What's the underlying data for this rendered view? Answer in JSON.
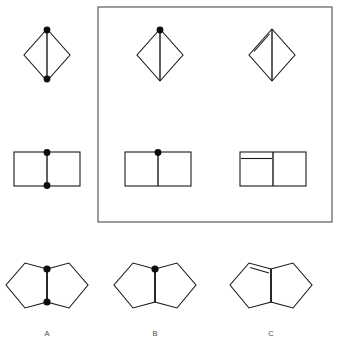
{
  "figure": {
    "title": "",
    "background_color": "#ffffff",
    "stroke_color": "#1a1a1a",
    "dot_color": "#0d0d0d",
    "box_color": "#5a5a5a",
    "width": 340,
    "height": 346
  },
  "answer_box": {
    "name": "answer-box-frame",
    "x": 98,
    "y": 7,
    "width": 234,
    "height": 215
  },
  "rows": [
    {
      "id": "row-diamond",
      "shape": "diamond",
      "items": [
        {
          "id": "diamond-prompt",
          "position": "left-outside-box",
          "cx": 47,
          "cy": 55,
          "rx": 23,
          "ry": 26,
          "divider": "vertical",
          "dots": [
            "top",
            "bottom"
          ],
          "double_edge": "none"
        },
        {
          "id": "diamond-option-1",
          "position": "in-box-left",
          "cx": 160,
          "cy": 55,
          "rx": 23,
          "ry": 26,
          "divider": "vertical",
          "dots": [
            "top"
          ],
          "double_edge": "none"
        },
        {
          "id": "diamond-option-2",
          "position": "in-box-right",
          "cx": 272,
          "cy": 55,
          "rx": 23,
          "ry": 26,
          "divider": "vertical",
          "dots": [],
          "double_edge": "upper-left"
        }
      ]
    },
    {
      "id": "row-rectangle",
      "shape": "rectangle",
      "items": [
        {
          "id": "rectangle-prompt",
          "position": "left-outside-box",
          "x": 14,
          "y": 152,
          "width": 66,
          "height": 34,
          "divider": "vertical-center",
          "dots": [
            "top",
            "bottom"
          ],
          "double_edge": "none"
        },
        {
          "id": "rectangle-option-1",
          "position": "in-box-left",
          "x": 125,
          "y": 152,
          "width": 66,
          "height": 34,
          "divider": "vertical-center",
          "dots": [
            "top"
          ],
          "double_edge": "none"
        },
        {
          "id": "rectangle-option-2",
          "position": "in-box-right",
          "x": 240,
          "y": 152,
          "width": 66,
          "height": 34,
          "divider": "vertical-center",
          "dots": [],
          "double_edge": "left-half-top-horizontal"
        }
      ]
    },
    {
      "id": "row-bicyclic",
      "shape": "fused-pentagons",
      "items": [
        {
          "id": "bicyclic-a",
          "label": "A",
          "cx": 47,
          "cy": 289,
          "dots": [
            "top",
            "bottom"
          ],
          "double_edge": "none"
        },
        {
          "id": "bicyclic-b",
          "label": "B",
          "cx": 155,
          "cy": 289,
          "dots": [
            "top"
          ],
          "double_edge": "none"
        },
        {
          "id": "bicyclic-c",
          "label": "C",
          "cx": 271,
          "cy": 289,
          "dots": [],
          "double_edge": "upper-left"
        }
      ]
    }
  ],
  "labels": {
    "a": "A",
    "b": "B",
    "c": "C",
    "a_x": 47,
    "b_x": 155,
    "c_x": 271,
    "y": 336
  }
}
